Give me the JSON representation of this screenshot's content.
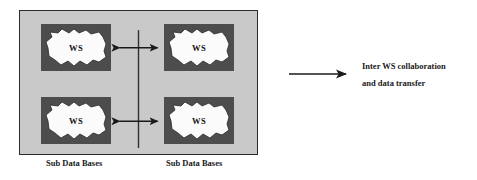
{
  "diagram": {
    "panel": {
      "background_color": "#c9c9c9",
      "border_color": "#2b2b2b"
    },
    "nodes": [
      {
        "id": "node-top-left",
        "label": "WS",
        "position": "top-left"
      },
      {
        "id": "node-top-right",
        "label": "WS",
        "position": "top-right"
      },
      {
        "id": "node-bottom-left",
        "label": "WS",
        "position": "bottom-left"
      },
      {
        "id": "node-bottom-right",
        "label": "WS",
        "position": "bottom-right"
      }
    ],
    "node_box_color": "#4d4d4d",
    "node_cloud_color": "#fbfbfb",
    "captions": {
      "left": "Sub Data Bases",
      "right": "Sub Data Bases"
    },
    "connectors": {
      "vertical_divider": true,
      "arrows": [
        {
          "id": "arrow-top",
          "style": "double-headed",
          "orientation": "horizontal"
        },
        {
          "id": "arrow-bottom",
          "style": "double-headed",
          "orientation": "horizontal"
        }
      ],
      "color": "#1a1a1a"
    }
  },
  "legend": {
    "arrow_style": "single-headed",
    "arrow_color": "#1a1a1a",
    "line1": "Inter WS collaboration",
    "line2": "and data transfer"
  }
}
